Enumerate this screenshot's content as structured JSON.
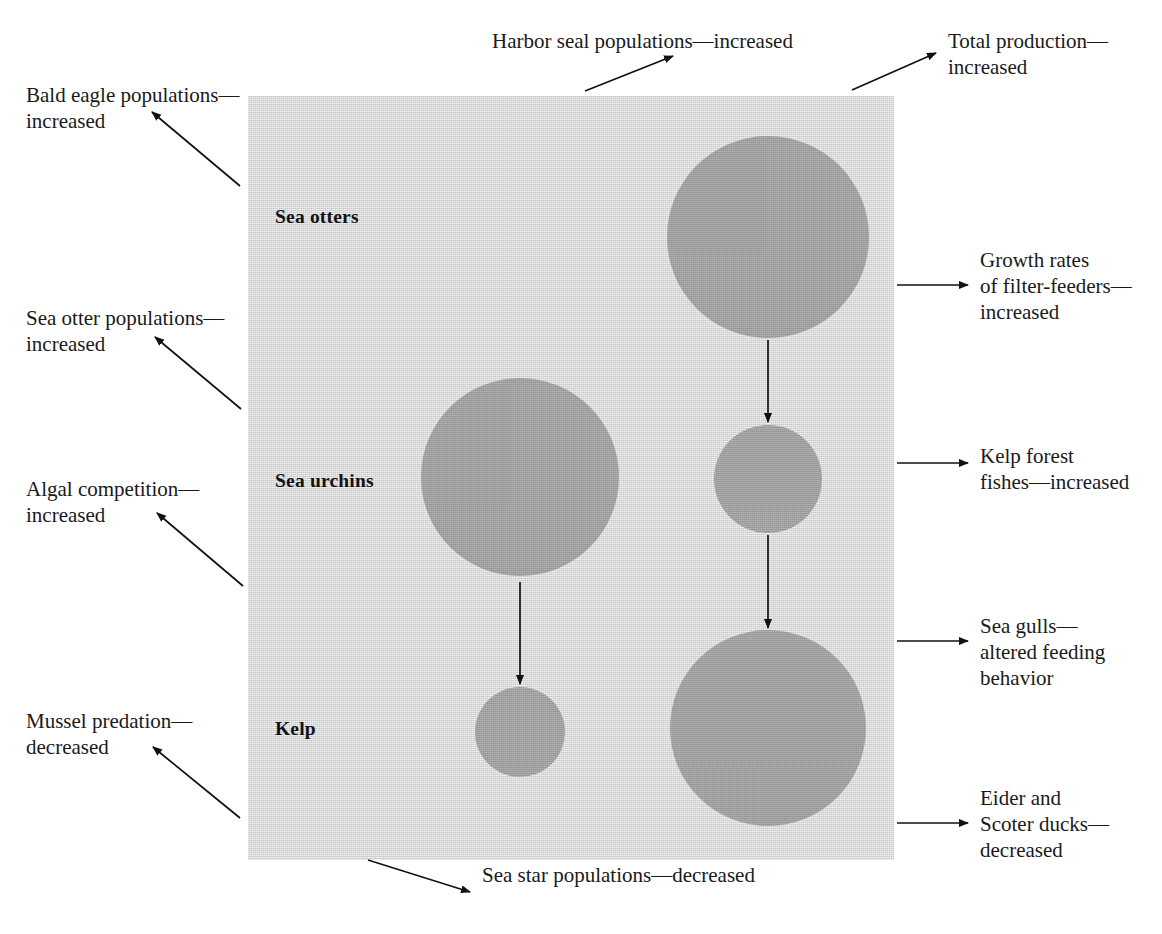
{
  "figure": {
    "type": "ecological-cascade-diagram",
    "panel_fill": "#c6c6c6",
    "blob_fill": "#9d9d9d",
    "background": "#ffffff"
  },
  "inner_labels": [
    {
      "id": "sea-otters",
      "text": "Sea otters",
      "x": 275,
      "y": 206
    },
    {
      "id": "sea-urchins",
      "text": "Sea urchins",
      "x": 275,
      "y": 470
    },
    {
      "id": "kelp",
      "text": "Kelp",
      "x": 275,
      "y": 718
    }
  ],
  "blobs": [
    {
      "id": "otter-blob-right",
      "cx": 768,
      "cy": 237,
      "r": 101
    },
    {
      "id": "urchin-blob-left",
      "cx": 520,
      "cy": 477,
      "r": 99
    },
    {
      "id": "urchin-blob-right",
      "cx": 768,
      "cy": 479,
      "r": 54
    },
    {
      "id": "kelp-blob-left",
      "cx": 520,
      "cy": 732,
      "r": 45
    },
    {
      "id": "kelp-blob-right",
      "cx": 768,
      "cy": 728,
      "r": 98
    }
  ],
  "internal_arrows": [
    {
      "id": "otters-to-urchins-right",
      "x1": 768,
      "y1": 340,
      "x2": 768,
      "y2": 422
    },
    {
      "id": "urchins-to-kelp-right",
      "x1": 768,
      "y1": 535,
      "x2": 768,
      "y2": 628
    },
    {
      "id": "urchins-to-kelp-left",
      "x1": 520,
      "y1": 582,
      "x2": 520,
      "y2": 684
    }
  ],
  "annotations": {
    "top": [
      {
        "id": "harbor-seal",
        "text": "Harbor seal populations—increased",
        "x": 492,
        "y": 28,
        "arrow": {
          "x1": 585,
          "y1": 91,
          "x2": 673,
          "y2": 56
        }
      },
      {
        "id": "total-production",
        "text": "Total production—\nincreased",
        "x": 948,
        "y": 28,
        "arrow": {
          "x1": 852,
          "y1": 90,
          "x2": 936,
          "y2": 53
        }
      }
    ],
    "left": [
      {
        "id": "bald-eagle",
        "text": "Bald eagle populations—\nincreased",
        "x": 26,
        "y": 82,
        "arrow": {
          "x1": 240,
          "y1": 186,
          "x2": 152,
          "y2": 112
        }
      },
      {
        "id": "sea-otter-populations",
        "text": "Sea otter populations—\nincreased",
        "x": 26,
        "y": 305,
        "arrow": {
          "x1": 241,
          "y1": 409,
          "x2": 155,
          "y2": 337
        }
      },
      {
        "id": "algal-competition",
        "text": "Algal competition—\nincreased",
        "x": 26,
        "y": 476,
        "arrow": {
          "x1": 243,
          "y1": 586,
          "x2": 157,
          "y2": 513
        }
      },
      {
        "id": "mussel-predation",
        "text": "Mussel predation—\ndecreased",
        "x": 26,
        "y": 708,
        "arrow": {
          "x1": 240,
          "y1": 818,
          "x2": 153,
          "y2": 747
        }
      }
    ],
    "right": [
      {
        "id": "filter-feeders",
        "text": "Growth rates\nof filter-feeders—\nincreased",
        "x": 980,
        "y": 247,
        "arrow": {
          "x1": 897,
          "y1": 285,
          "x2": 968,
          "y2": 285
        }
      },
      {
        "id": "kelp-forest-fishes",
        "text": "Kelp forest\nfishes—increased",
        "x": 980,
        "y": 443,
        "arrow": {
          "x1": 897,
          "y1": 463,
          "x2": 968,
          "y2": 463
        }
      },
      {
        "id": "sea-gulls",
        "text": "Sea gulls—\naltered feeding\nbehavior",
        "x": 980,
        "y": 613,
        "arrow": {
          "x1": 897,
          "y1": 641,
          "x2": 968,
          "y2": 641
        }
      },
      {
        "id": "eider-scoter-ducks",
        "text": "Eider and\nScoter ducks—\ndecreased",
        "x": 980,
        "y": 785,
        "arrow": {
          "x1": 897,
          "y1": 823,
          "x2": 968,
          "y2": 823
        }
      }
    ],
    "bottom": [
      {
        "id": "sea-star",
        "text": "Sea star populations—decreased",
        "x": 482,
        "y": 862,
        "arrow": {
          "x1": 368,
          "y1": 860,
          "x2": 470,
          "y2": 892
        }
      }
    ]
  }
}
